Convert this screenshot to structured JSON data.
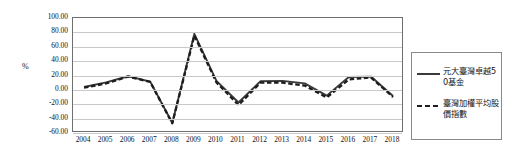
{
  "chart_data": {
    "type": "line",
    "title": "",
    "xlabel": "",
    "ylabel": "%",
    "ylim": [
      -60,
      100
    ],
    "ytick_step": 20,
    "grid": true,
    "legend_position": "right",
    "categories": [
      "2004",
      "2005",
      "2006",
      "2007",
      "2008",
      "2009",
      "2010",
      "2011",
      "2012",
      "2013",
      "2014",
      "2015",
      "2016",
      "2017",
      "2018"
    ],
    "ytick_labels": [
      "100.00",
      "80.00",
      "60.00",
      "40.00",
      "20.00",
      "0.00",
      "-20.00",
      "-40.00",
      "-60.00"
    ],
    "series": [
      {
        "name": "元大臺灣卓越50基金",
        "style": "solid",
        "color": "#3a3a3a",
        "values": [
          4.0,
          10.5,
          19.0,
          11.5,
          -46.0,
          78.0,
          12.5,
          -17.5,
          12.0,
          12.5,
          9.0,
          -8.0,
          18.0,
          18.5,
          -8.5
        ]
      },
      {
        "name": "臺灣加權平均股價指數",
        "style": "dashed",
        "color": "#1d1d1d",
        "values": [
          3.0,
          9.0,
          18.5,
          11.0,
          -46.5,
          75.5,
          10.5,
          -21.0,
          10.0,
          10.0,
          6.0,
          -10.5,
          14.5,
          17.5,
          -10.0
        ]
      }
    ]
  },
  "legend": {
    "items": [
      {
        "label": "元大臺灣卓越50基金",
        "style": "solid"
      },
      {
        "label": "臺灣加權平均股價指數",
        "style": "dashed"
      }
    ]
  },
  "axis": {
    "y_title": "%"
  }
}
